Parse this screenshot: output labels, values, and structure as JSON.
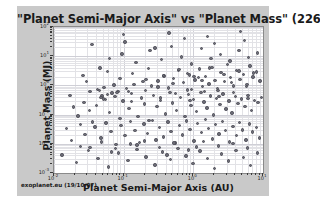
{
  "figure": {
    "title": "\"Planet Semi-Major Axis\"  vs  \"Planet Mass\" (226)",
    "credit": "exoplanet.eu (19/10/07)",
    "panel_color": "#c9c9c9",
    "plot_background": "#ffffff",
    "point_color": "#6e6e78",
    "point_edge_color": "#4a4a54",
    "grid_color": "#e2e2e6"
  },
  "chart_data": {
    "type": "scatter",
    "title": "\"Planet Semi-Major Axis\"  vs  \"Planet Mass\" (226)",
    "xlabel": "Planet Semi-Major Axis (AU)",
    "ylabel": "Planet Mass (MJ)",
    "n_points": 226,
    "xscale": "log",
    "yscale": "log",
    "xlim": [
      0.01,
      10
    ],
    "ylim": [
      0.001,
      100
    ],
    "grid": true,
    "legend": null,
    "xticks": [
      {
        "value": 0.01,
        "label": "10",
        "exp": "-2"
      },
      {
        "value": 0.1,
        "label": "10",
        "exp": "-1"
      },
      {
        "value": 1,
        "label": "10",
        "exp": "0"
      },
      {
        "value": 10,
        "label": "10",
        "exp": "1"
      }
    ],
    "yticks": [
      {
        "value": 0.001,
        "label": "10",
        "exp": "-3"
      },
      {
        "value": 0.01,
        "label": "10",
        "exp": "-2"
      },
      {
        "value": 0.1,
        "label": "10",
        "exp": "-1"
      },
      {
        "value": 1,
        "label": "10",
        "exp": "0"
      },
      {
        "value": 10,
        "label": "10",
        "exp": "1"
      },
      {
        "value": 100,
        "label": "10",
        "exp": "2"
      }
    ],
    "marker": "circle",
    "marker_size": 3.4,
    "points": [
      [
        0.046,
        3.9
      ],
      [
        0.029,
        1.35
      ],
      [
        0.052,
        0.86
      ],
      [
        0.045,
        0.67
      ],
      [
        0.11,
        0.78
      ],
      [
        0.049,
        0.44
      ],
      [
        0.83,
        2.6
      ],
      [
        1.18,
        1.9
      ],
      [
        0.058,
        0.49
      ],
      [
        0.047,
        0.39
      ],
      [
        0.068,
        0.55
      ],
      [
        0.083,
        0.63
      ],
      [
        0.14,
        1.1
      ],
      [
        0.21,
        1.6
      ],
      [
        0.25,
        0.95
      ],
      [
        0.31,
        1.4
      ],
      [
        0.38,
        2.1
      ],
      [
        0.44,
        0.82
      ],
      [
        0.52,
        1.7
      ],
      [
        0.61,
        3.2
      ],
      [
        0.72,
        1.25
      ],
      [
        0.88,
        2.3
      ],
      [
        0.95,
        0.74
      ],
      [
        1.05,
        1.55
      ],
      [
        1.22,
        3.6
      ],
      [
        1.35,
        0.91
      ],
      [
        1.5,
        2.05
      ],
      [
        1.67,
        1.12
      ],
      [
        1.85,
        4.1
      ],
      [
        2.05,
        1.48
      ],
      [
        2.25,
        0.68
      ],
      [
        2.5,
        2.75
      ],
      [
        2.8,
        1.35
      ],
      [
        3.1,
        5.2
      ],
      [
        3.4,
        1.85
      ],
      [
        3.8,
        0.96
      ],
      [
        4.2,
        3.3
      ],
      [
        4.7,
        1.6
      ],
      [
        5.2,
        2.4
      ],
      [
        5.9,
        1.08
      ],
      [
        6.5,
        4.6
      ],
      [
        7.2,
        1.95
      ],
      [
        8.1,
        2.85
      ],
      [
        9.0,
        1.42
      ],
      [
        0.019,
        0.18
      ],
      [
        0.022,
        0.09
      ],
      [
        0.027,
        0.26
      ],
      [
        0.032,
        0.14
      ],
      [
        0.036,
        0.055
      ],
      [
        0.041,
        0.21
      ],
      [
        0.055,
        0.33
      ],
      [
        0.063,
        0.12
      ],
      [
        0.075,
        0.41
      ],
      [
        0.089,
        0.074
      ],
      [
        0.098,
        0.29
      ],
      [
        0.12,
        0.16
      ],
      [
        0.13,
        0.52
      ],
      [
        0.16,
        0.085
      ],
      [
        0.18,
        0.37
      ],
      [
        0.2,
        0.23
      ],
      [
        0.23,
        0.063
      ],
      [
        0.27,
        0.45
      ],
      [
        0.3,
        0.19
      ],
      [
        0.34,
        0.31
      ],
      [
        0.4,
        0.105
      ],
      [
        0.46,
        0.58
      ],
      [
        0.5,
        0.25
      ],
      [
        0.57,
        0.14
      ],
      [
        0.66,
        0.39
      ],
      [
        0.76,
        0.088
      ],
      [
        0.85,
        0.48
      ],
      [
        0.92,
        0.21
      ],
      [
        1.0,
        0.33
      ],
      [
        1.1,
        0.125
      ],
      [
        1.28,
        0.56
      ],
      [
        1.42,
        0.27
      ],
      [
        1.58,
        0.17
      ],
      [
        1.75,
        0.43
      ],
      [
        1.95,
        0.097
      ],
      [
        2.15,
        0.36
      ],
      [
        2.4,
        0.22
      ],
      [
        2.65,
        0.51
      ],
      [
        2.95,
        0.155
      ],
      [
        3.25,
        0.29
      ],
      [
        3.6,
        0.115
      ],
      [
        4.0,
        0.42
      ],
      [
        4.4,
        0.24
      ],
      [
        4.9,
        0.34
      ],
      [
        5.5,
        0.19
      ],
      [
        6.1,
        0.46
      ],
      [
        6.8,
        0.135
      ],
      [
        7.6,
        0.31
      ],
      [
        8.5,
        0.26
      ],
      [
        9.5,
        0.39
      ],
      [
        0.015,
        0.034
      ],
      [
        0.018,
        0.013
      ],
      [
        0.024,
        0.046
      ],
      [
        0.028,
        0.021
      ],
      [
        0.033,
        0.0075
      ],
      [
        0.039,
        0.038
      ],
      [
        0.047,
        0.016
      ],
      [
        0.056,
        0.052
      ],
      [
        0.066,
        0.026
      ],
      [
        0.078,
        0.0095
      ],
      [
        0.092,
        0.043
      ],
      [
        0.105,
        0.019
      ],
      [
        0.125,
        0.058
      ],
      [
        0.145,
        0.029
      ],
      [
        0.17,
        0.011
      ],
      [
        0.195,
        0.048
      ],
      [
        0.22,
        0.023
      ],
      [
        0.26,
        0.064
      ],
      [
        0.29,
        0.0135
      ],
      [
        0.33,
        0.036
      ],
      [
        0.37,
        0.017
      ],
      [
        0.43,
        0.055
      ],
      [
        0.48,
        0.026
      ],
      [
        0.55,
        0.0105
      ],
      [
        0.63,
        0.042
      ],
      [
        0.7,
        0.02
      ],
      [
        0.8,
        0.061
      ],
      [
        0.9,
        0.031
      ],
      [
        1.02,
        0.0125
      ],
      [
        1.15,
        0.05
      ],
      [
        1.3,
        0.024
      ],
      [
        1.48,
        0.068
      ],
      [
        1.65,
        0.033
      ],
      [
        1.88,
        0.0145
      ],
      [
        2.1,
        0.045
      ],
      [
        2.35,
        0.022
      ],
      [
        2.6,
        0.057
      ],
      [
        2.9,
        0.028
      ],
      [
        3.3,
        0.0115
      ],
      [
        3.7,
        0.04
      ],
      [
        4.15,
        0.019
      ],
      [
        4.6,
        0.053
      ],
      [
        5.1,
        0.03
      ],
      [
        5.7,
        0.0135
      ],
      [
        6.4,
        0.047
      ],
      [
        7.1,
        0.025
      ],
      [
        8.0,
        0.036
      ],
      [
        8.9,
        0.016
      ],
      [
        0.013,
        0.0042
      ],
      [
        0.021,
        0.0023
      ],
      [
        0.031,
        0.0058
      ],
      [
        0.043,
        0.0031
      ],
      [
        0.061,
        0.0016
      ],
      [
        0.085,
        0.0049
      ],
      [
        0.115,
        0.0027
      ],
      [
        0.155,
        0.0063
      ],
      [
        0.21,
        0.0035
      ],
      [
        0.28,
        0.0019
      ],
      [
        0.36,
        0.0052
      ],
      [
        0.47,
        0.0029
      ],
      [
        0.6,
        0.0068
      ],
      [
        0.78,
        0.0038
      ],
      [
        0.99,
        0.0021
      ],
      [
        1.25,
        0.0056
      ],
      [
        1.6,
        0.0032
      ],
      [
        2.0,
        0.0014
      ],
      [
        2.55,
        0.0045
      ],
      [
        3.2,
        0.0026
      ],
      [
        4.1,
        0.006
      ],
      [
        5.2,
        0.0034
      ],
      [
        6.6,
        0.0018
      ],
      [
        8.3,
        0.0048
      ],
      [
        0.062,
        8.5
      ],
      [
        0.095,
        12.0
      ],
      [
        0.15,
        6.2
      ],
      [
        0.24,
        15.5
      ],
      [
        0.35,
        7.8
      ],
      [
        0.49,
        22.0
      ],
      [
        0.68,
        9.5
      ],
      [
        0.94,
        5.4
      ],
      [
        1.3,
        18.0
      ],
      [
        1.8,
        8.2
      ],
      [
        2.45,
        11.5
      ],
      [
        3.35,
        6.8
      ],
      [
        4.55,
        16.0
      ],
      [
        6.2,
        9.0
      ],
      [
        8.4,
        13.0
      ],
      [
        0.035,
        25.0
      ],
      [
        0.105,
        31.0
      ],
      [
        0.28,
        19.0
      ],
      [
        0.75,
        40.0
      ],
      [
        2.0,
        27.0
      ],
      [
        5.4,
        35.0
      ],
      [
        0.042,
        0.72
      ],
      [
        0.073,
        1.02
      ],
      [
        0.118,
        0.61
      ],
      [
        0.19,
        1.35
      ],
      [
        0.31,
        0.88
      ],
      [
        0.51,
        1.18
      ],
      [
        0.82,
        0.69
      ],
      [
        1.33,
        1.45
      ],
      [
        2.2,
        0.79
      ],
      [
        3.55,
        1.28
      ],
      [
        5.8,
        0.93
      ],
      [
        0.026,
        2.15
      ],
      [
        0.058,
        3.05
      ],
      [
        0.088,
        1.72
      ],
      [
        0.135,
        2.55
      ],
      [
        0.225,
        3.75
      ],
      [
        0.37,
        2.22
      ],
      [
        0.62,
        3.45
      ],
      [
        1.02,
        2.05
      ],
      [
        1.7,
        3.95
      ],
      [
        2.75,
        2.35
      ],
      [
        4.5,
        3.15
      ],
      [
        7.3,
        2.65
      ],
      [
        0.017,
        0.45
      ],
      [
        0.033,
        0.62
      ],
      [
        0.051,
        0.34
      ],
      [
        0.08,
        0.58
      ],
      [
        0.13,
        0.28
      ],
      [
        0.205,
        0.66
      ],
      [
        0.34,
        0.37
      ],
      [
        0.56,
        0.53
      ],
      [
        0.9,
        0.3
      ],
      [
        1.45,
        0.61
      ],
      [
        2.35,
        0.42
      ],
      [
        3.8,
        0.57
      ],
      [
        6.1,
        0.35
      ],
      [
        0.024,
        0.0082
      ],
      [
        0.048,
        0.0115
      ],
      [
        0.077,
        0.0068
      ],
      [
        0.125,
        0.0098
      ],
      [
        0.2,
        0.0125
      ],
      [
        0.325,
        0.0075
      ],
      [
        0.53,
        0.0108
      ],
      [
        0.86,
        0.0062
      ],
      [
        1.4,
        0.0118
      ],
      [
        2.28,
        0.0085
      ],
      [
        3.7,
        0.0102
      ],
      [
        5.95,
        0.0072
      ],
      [
        0.1,
        55.0
      ],
      [
        0.45,
        62.0
      ],
      [
        1.6,
        48.0
      ],
      [
        4.8,
        70.0
      ],
      [
        0.067,
        0.0052
      ],
      [
        0.155,
        0.0091
      ],
      [
        0.42,
        0.0041
      ],
      [
        1.12,
        0.0078
      ]
    ]
  }
}
